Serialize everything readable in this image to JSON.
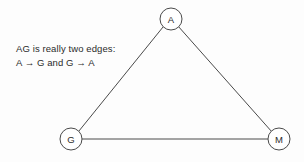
{
  "diagram": {
    "background_color": "#fdfdfd",
    "stroke_color": "#4a4a4a",
    "text_color": "#2b2b2b",
    "nodes": [
      {
        "id": "A",
        "label": "A",
        "cx": 171,
        "cy": 19,
        "r": 11
      },
      {
        "id": "G",
        "label": "G",
        "cx": 71,
        "cy": 139,
        "r": 11
      },
      {
        "id": "M",
        "label": "M",
        "cx": 279,
        "cy": 139,
        "r": 11
      }
    ],
    "edges": [
      {
        "id": "AG",
        "from": "A",
        "to": "G",
        "x1": 163.2,
        "y1": 26.8,
        "x2": 78.8,
        "y2": 131.2
      },
      {
        "id": "AM",
        "from": "A",
        "to": "M",
        "x1": 178.7,
        "y1": 26.8,
        "x2": 271.3,
        "y2": 131.2
      },
      {
        "id": "GM",
        "from": "G",
        "to": "M",
        "x1": 82,
        "y1": 139,
        "x2": 268,
        "y2": 139
      }
    ]
  },
  "annotation": {
    "line1": "AG is really two edges:",
    "line2": "A → G and G → A"
  }
}
